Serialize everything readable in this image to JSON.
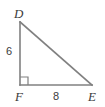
{
  "figure": {
    "shape": "right-triangle",
    "stroke_color": "#808080",
    "label_color": "#3b3b3b",
    "background_color": "#ffffff",
    "vertices": [
      {
        "name": "D",
        "label": "D",
        "x": 20,
        "y": 22,
        "label_x": 14,
        "label_y": 7
      },
      {
        "name": "F",
        "label": "F",
        "x": 20,
        "y": 85,
        "label_x": 15,
        "label_y": 90
      },
      {
        "name": "E",
        "label": "E",
        "x": 92,
        "y": 85,
        "label_x": 88,
        "label_y": 90
      }
    ],
    "sides": [
      {
        "name": "DF",
        "role": "vertical-leg",
        "label": "6",
        "label_x": 6,
        "label_y": 46
      },
      {
        "name": "FE",
        "role": "horizontal-leg",
        "label": "8",
        "label_x": 53,
        "label_y": 91
      },
      {
        "name": "DE",
        "role": "hypotenuse",
        "label": ""
      }
    ],
    "right_angle": {
      "at_vertex": "F",
      "marker": "square",
      "size": 8
    }
  }
}
